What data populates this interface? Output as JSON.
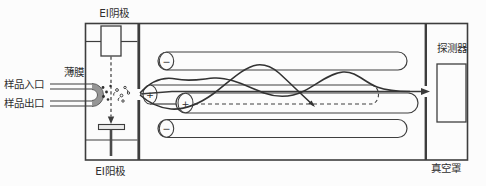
{
  "diagram": {
    "labels": {
      "ei_cathode": "EI阴极",
      "membrane": "薄膜",
      "sample_inlet": "样品入口",
      "sample_outlet": "样品出口",
      "ei_anode": "EI阳极",
      "detector": "探测器",
      "vacuum_housing": "真空罩"
    },
    "rods": [
      {
        "name": "top-rod",
        "sign": "−"
      },
      {
        "name": "back-middle-rod",
        "sign": "+"
      },
      {
        "name": "front-middle-rod",
        "sign": "+"
      },
      {
        "name": "bottom-rod",
        "sign": "−"
      }
    ],
    "colors": {
      "line": "#3d3d3d",
      "membrane_gray": "#969696",
      "background": "#fcfcfc"
    }
  }
}
